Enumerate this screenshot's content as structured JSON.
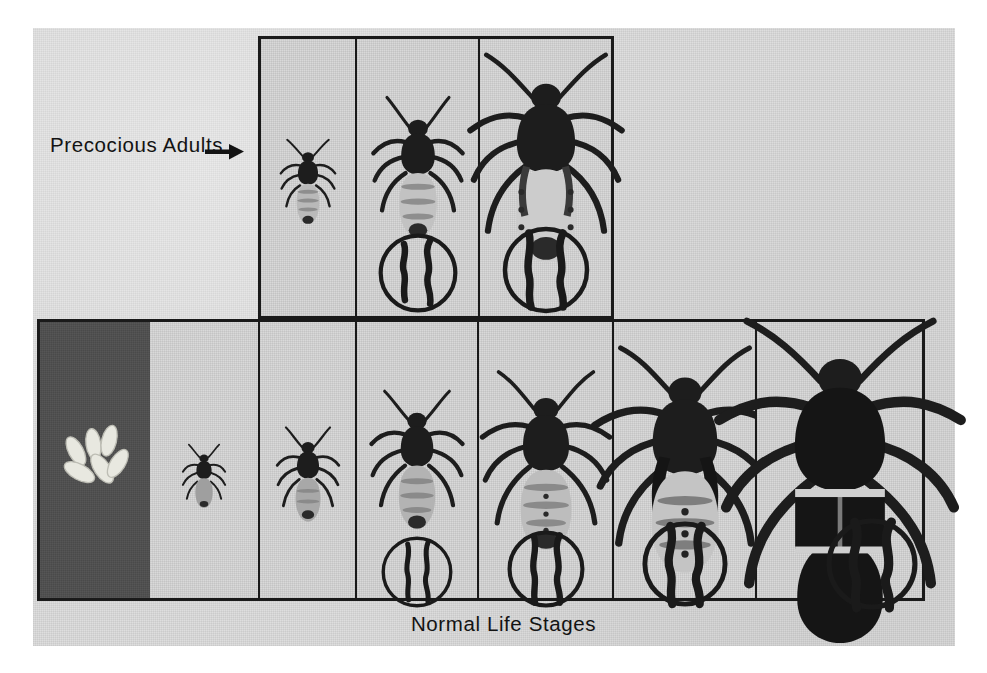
{
  "figure": {
    "background_color": "#ffffff",
    "plate_color": "#dedede",
    "ink_color": "#1a1a1a",
    "dark_panel_color": "#4a4a4a",
    "precocious_label": "Precocious Adults",
    "precocious_arrow_icon": "right-arrow-icon",
    "normal_caption": "Normal Life Stages"
  },
  "top_row": {
    "name": "precocious-adults-row",
    "panels": [
      {
        "id": "top-1",
        "stage": "precocious adult, smallest",
        "specimen": "bug",
        "scale": 0.4,
        "has_inset": false,
        "background": "light"
      },
      {
        "id": "top-2",
        "stage": "precocious adult, medium",
        "specimen": "bug",
        "scale": 0.62,
        "has_inset": true,
        "background": "light"
      },
      {
        "id": "top-3",
        "stage": "precocious adult, largest",
        "specimen": "bug",
        "scale": 0.88,
        "has_inset": true,
        "background": "light"
      }
    ]
  },
  "bottom_row": {
    "name": "normal-life-stages-row",
    "panels": [
      {
        "id": "bot-1",
        "stage": "eggs",
        "specimen": "eggs",
        "egg_count": 6,
        "scale": 1.0,
        "has_inset": false,
        "background": "dark"
      },
      {
        "id": "bot-2",
        "stage": "first instar",
        "specimen": "bug",
        "scale": 0.33,
        "has_inset": false,
        "background": "light"
      },
      {
        "id": "bot-3",
        "stage": "second instar",
        "specimen": "bug",
        "scale": 0.44,
        "has_inset": false,
        "background": "light"
      },
      {
        "id": "bot-4",
        "stage": "third instar",
        "specimen": "bug",
        "scale": 0.6,
        "has_inset": true,
        "background": "light"
      },
      {
        "id": "bot-5",
        "stage": "fourth instar",
        "specimen": "bug",
        "scale": 0.74,
        "has_inset": true,
        "background": "light"
      },
      {
        "id": "bot-6",
        "stage": "fifth instar",
        "specimen": "bug",
        "scale": 0.92,
        "has_inset": true,
        "background": "light"
      },
      {
        "id": "bot-7",
        "stage": "adult",
        "specimen": "bug",
        "scale": 1.15,
        "has_inset": true,
        "background": "light"
      }
    ]
  },
  "insets": {
    "description": "circular magnified detail of hind tibia / wing pad",
    "icon": "circle-detail-icon"
  }
}
